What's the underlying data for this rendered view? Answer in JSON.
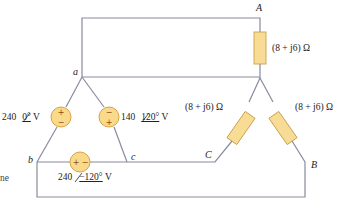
{
  "diagram": {
    "type": "three-phase delta-source to wye-load circuit",
    "nodes": {
      "a": "a",
      "b": "b",
      "c": "c",
      "A": "A",
      "B": "B",
      "C": "C"
    },
    "sources": [
      {
        "id": "Vab",
        "magnitude": "240",
        "angle": "0°",
        "unit": "V",
        "polarity_top": "+",
        "polarity_bottom": "−"
      },
      {
        "id": "Vca",
        "magnitude": "140",
        "angle": "120°",
        "unit": "V",
        "polarity_top": "−",
        "polarity_bottom": "+"
      },
      {
        "id": "Vbc",
        "magnitude": "240",
        "angle": "−120°",
        "unit": "V",
        "polarity_left": "+",
        "polarity_right": "−"
      }
    ],
    "loads": [
      {
        "id": "ZA",
        "value": "(8 + j6) Ω",
        "real": "8",
        "imag": "6"
      },
      {
        "id": "ZC",
        "value": "(8 + j6) Ω",
        "real": "8",
        "imag": "6"
      },
      {
        "id": "ZB",
        "value": "(8 + j6) Ω",
        "real": "8",
        "imag": "6"
      }
    ],
    "edge_fragments": {
      "bottom_left": "ne"
    },
    "colors": {
      "wire": "#8a8aa0",
      "resistor_fill": "#f8dc96",
      "resistor_stroke": "#c9a048",
      "source_fill": "#f9d98a",
      "source_stroke": "#d49a3a"
    }
  }
}
